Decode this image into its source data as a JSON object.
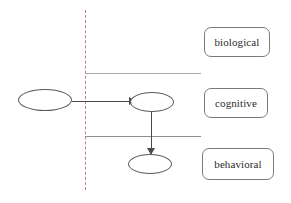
{
  "diagram": {
    "colors": {
      "divider": "#c77b7b",
      "separator": "#8e8e8e",
      "node_stroke": "#5a5a5a",
      "connector": "#4a4a4a",
      "label_border": "#7a7a7a",
      "label_text": "#2b2b2b",
      "background": "#ffffff"
    },
    "divider": {
      "name": "vertical-dashed-divider",
      "style": "dashed",
      "x": 85,
      "y_top": 10,
      "y_bottom": 190
    },
    "separators": [
      {
        "name": "separator-biological-cognitive",
        "x": 85,
        "y": 73,
        "width": 116
      },
      {
        "name": "separator-cognitive-behavioral",
        "x": 85,
        "y": 136,
        "width": 116
      }
    ],
    "nodes": [
      {
        "name": "node-left",
        "label": "",
        "cx": 45,
        "cy": 100,
        "rx": 27,
        "ry": 11
      },
      {
        "name": "node-middle",
        "label": "",
        "cx": 152,
        "cy": 102,
        "rx": 22,
        "ry": 10
      },
      {
        "name": "node-bottom",
        "label": "",
        "cx": 150,
        "cy": 164,
        "rx": 22,
        "ry": 10
      }
    ],
    "edges": [
      {
        "name": "edge-left-to-middle",
        "from": "node-left",
        "to": "node-middle",
        "orientation": "horizontal",
        "arrowhead": "open-right"
      },
      {
        "name": "edge-middle-to-bottom",
        "from": "node-middle",
        "to": "node-bottom",
        "orientation": "vertical",
        "arrowhead": "open-down"
      }
    ],
    "tiers": [
      {
        "name": "tier-label-biological",
        "label": "biological",
        "x": 204,
        "y": 27,
        "width": 66,
        "height": 30
      },
      {
        "name": "tier-label-cognitive",
        "label": "cognitive",
        "x": 204,
        "y": 88,
        "width": 64,
        "height": 30
      },
      {
        "name": "tier-label-behavioral",
        "label": "behavioral",
        "x": 202,
        "y": 148,
        "width": 72,
        "height": 32
      }
    ]
  }
}
